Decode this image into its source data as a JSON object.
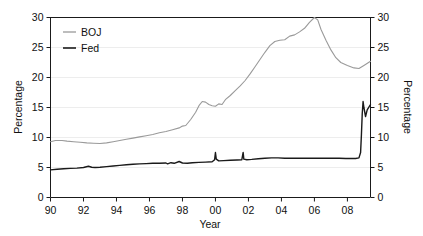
{
  "chart_data": {
    "type": "line",
    "title": "",
    "xlabel": "Year",
    "ylabel": "Percentage",
    "ylabel_right": "Percentage",
    "xlim": [
      1990,
      2009.4
    ],
    "ylim": [
      0,
      30
    ],
    "xticks": [
      1990,
      1992,
      1994,
      1996,
      1998,
      2000,
      2002,
      2004,
      2006,
      2008
    ],
    "xticklabels": [
      "90",
      "92",
      "94",
      "96",
      "98",
      "00",
      "02",
      "04",
      "06",
      "08"
    ],
    "yticks": [
      0,
      5,
      10,
      15,
      20,
      25,
      30
    ],
    "yticklabels": [
      "0",
      "5",
      "10",
      "15",
      "20",
      "25",
      "30"
    ],
    "yticks_right": [
      0,
      5,
      10,
      15,
      20,
      25,
      30
    ],
    "yticklabels_right": [
      "0",
      "5",
      "10",
      "15",
      "20",
      "25",
      "30"
    ],
    "grid": "horizontal",
    "legend_position": "top-left",
    "series": [
      {
        "name": "BOJ",
        "color": "#9a9a9a",
        "x": [
          1990.0,
          1990.3,
          1990.7,
          1991.0,
          1991.4,
          1991.8,
          1992.2,
          1992.6,
          1993.0,
          1993.4,
          1993.8,
          1994.2,
          1994.6,
          1995.0,
          1995.4,
          1995.8,
          1996.2,
          1996.6,
          1997.0,
          1997.4,
          1997.8,
          1998.0,
          1998.2,
          1998.5,
          1998.8,
          1999.0,
          1999.2,
          1999.4,
          1999.6,
          1999.8,
          2000.0,
          2000.2,
          2000.4,
          2000.6,
          2000.9,
          2001.2,
          2001.5,
          2001.8,
          2002.1,
          2002.4,
          2002.7,
          2003.0,
          2003.3,
          2003.6,
          2003.9,
          2004.2,
          2004.5,
          2004.8,
          2005.1,
          2005.4,
          2005.7,
          2006.0,
          2006.2,
          2006.4,
          2006.7,
          2007.0,
          2007.3,
          2007.6,
          2008.0,
          2008.4,
          2008.7,
          2009.0,
          2009.4
        ],
        "y": [
          9.3,
          9.5,
          9.5,
          9.4,
          9.3,
          9.2,
          9.1,
          9.05,
          9.0,
          9.1,
          9.3,
          9.5,
          9.7,
          9.9,
          10.1,
          10.3,
          10.5,
          10.8,
          11.0,
          11.3,
          11.6,
          11.9,
          12.0,
          13.0,
          14.2,
          15.3,
          16.0,
          15.9,
          15.5,
          15.3,
          15.2,
          15.6,
          15.5,
          16.3,
          17.0,
          17.8,
          18.6,
          19.5,
          20.6,
          21.8,
          23.0,
          24.2,
          25.3,
          26.0,
          26.2,
          26.3,
          26.9,
          27.1,
          27.6,
          28.2,
          29.2,
          30.0,
          29.6,
          28.0,
          26.2,
          24.6,
          23.3,
          22.5,
          22.0,
          21.6,
          21.5,
          22.0,
          22.7
        ],
        "end_value": 22.7,
        "peak_value": 30.0,
        "peak_year": 2006
      },
      {
        "name": "Fed",
        "color": "#1a1a1a",
        "x": [
          1990.0,
          1990.4,
          1990.8,
          1991.2,
          1991.6,
          1992.0,
          1992.3,
          1992.5,
          1992.7,
          1993.0,
          1993.4,
          1993.8,
          1994.2,
          1994.6,
          1995.0,
          1995.4,
          1995.8,
          1996.2,
          1996.6,
          1997.0,
          1997.1,
          1997.3,
          1997.5,
          1997.8,
          1998.0,
          1998.3,
          1998.6,
          1999.0,
          1999.4,
          1999.8,
          1999.95,
          2000.0,
          2000.05,
          2000.2,
          2000.5,
          2000.9,
          2001.3,
          2001.6,
          2001.68,
          2001.72,
          2001.9,
          2002.2,
          2002.6,
          2003.0,
          2003.4,
          2003.8,
          2004.2,
          2004.6,
          2005.0,
          2005.5,
          2006.0,
          2006.5,
          2007.0,
          2007.5,
          2007.9,
          2008.2,
          2008.5,
          2008.7,
          2008.8,
          2008.85,
          2008.9,
          2008.95,
          2009.0,
          2009.1,
          2009.2,
          2009.4
        ],
        "y": [
          4.6,
          4.7,
          4.8,
          4.85,
          4.9,
          5.0,
          5.2,
          5.05,
          5.0,
          5.05,
          5.15,
          5.25,
          5.35,
          5.45,
          5.55,
          5.6,
          5.65,
          5.7,
          5.7,
          5.75,
          5.6,
          5.8,
          5.7,
          6.0,
          5.75,
          5.7,
          5.8,
          5.85,
          5.9,
          5.95,
          6.3,
          7.5,
          6.4,
          6.1,
          6.15,
          6.2,
          6.25,
          6.3,
          7.5,
          6.4,
          6.3,
          6.35,
          6.45,
          6.55,
          6.6,
          6.6,
          6.55,
          6.55,
          6.55,
          6.55,
          6.55,
          6.55,
          6.55,
          6.55,
          6.5,
          6.5,
          6.5,
          6.6,
          7.5,
          10.5,
          14.0,
          16.0,
          15.0,
          13.5,
          14.6,
          15.5
        ],
        "end_value": 15.5,
        "peak_value": 16.0,
        "peak_year": 2008.95
      }
    ]
  },
  "legend": {
    "items": [
      {
        "label": "BOJ"
      },
      {
        "label": "Fed"
      }
    ]
  },
  "axes": {
    "left_title": "Percentage",
    "right_title": "Percentage",
    "bottom_title": "Year"
  }
}
